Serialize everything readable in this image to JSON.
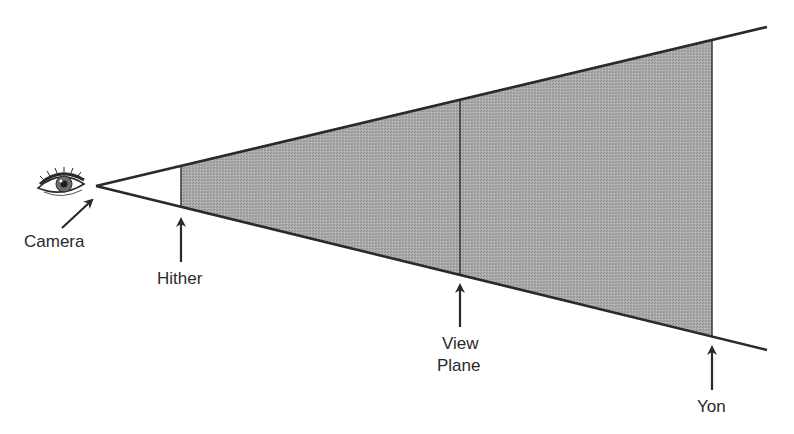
{
  "diagram": {
    "labels": {
      "camera": "Camera",
      "hither": "Hither",
      "view_plane_line1": "View",
      "view_plane_line2": "Plane",
      "yon": "Yon"
    },
    "icons": {
      "camera": "eye-icon"
    },
    "colors": {
      "line": "#2a2a2a",
      "fill": "#a8a8a8",
      "background": "#ffffff"
    }
  }
}
